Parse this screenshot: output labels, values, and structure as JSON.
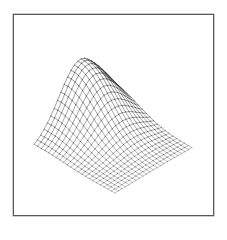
{
  "figure": {
    "type": "3d-wireframe-surface",
    "frame": {
      "x": 13,
      "y": 14,
      "width": 201,
      "height": 202,
      "color": "#5a5a5a"
    },
    "mesh": {
      "rows": 22,
      "cols": 22,
      "line_color": "#3a3a3a",
      "ground_corners": {
        "left": [
          34,
          150
        ],
        "front": [
          115,
          193
        ],
        "right": [
          192,
          148
        ],
        "back": [
          108,
          104
        ]
      },
      "height": {
        "amplitude": 62,
        "peak_u": 0.02,
        "peak_v": 0.62,
        "spread_u": 0.22,
        "spread_v": 0.16
      }
    }
  }
}
